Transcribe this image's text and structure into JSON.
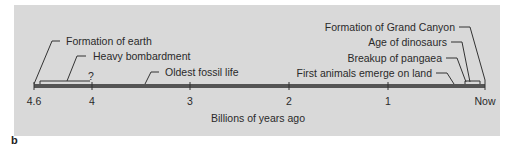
{
  "figure": {
    "panel_letter": "b",
    "axis_label": "Billions of years ago",
    "ticks": [
      "4.6",
      "4",
      "3",
      "2",
      "1",
      "Now"
    ],
    "uncertain_marker": "?",
    "colors": {
      "panel_bg": "#d9d9d9",
      "bar": "#555555",
      "text": "#2a2a2a"
    },
    "events_left": [
      {
        "label": "Formation of earth"
      },
      {
        "label": "Heavy bombardment"
      },
      {
        "label": "Oldest fossil life"
      }
    ],
    "events_right": [
      {
        "label": "Formation of Grand Canyon"
      },
      {
        "label": "Age of dinosaurs"
      },
      {
        "label": "Breakup of pangaea"
      },
      {
        "label": "First animals emerge on land"
      }
    ]
  }
}
